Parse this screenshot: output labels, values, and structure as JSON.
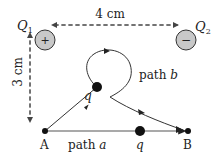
{
  "diagram": {
    "type": "physics-electric-field-paths",
    "charges": [
      {
        "id": "Q1",
        "label": "Q",
        "subscript": "1",
        "sign": "+",
        "fill": "#c8c8c8"
      },
      {
        "id": "Q2",
        "label": "Q",
        "subscript": "2",
        "sign": "−",
        "fill": "#c8c8c8"
      }
    ],
    "dimensions": {
      "horizontal": "4 cm",
      "vertical": "3 cm"
    },
    "points": {
      "start": "A",
      "end": "B"
    },
    "test_charge": "q",
    "paths": {
      "a": {
        "prefix": "path ",
        "name": "a"
      },
      "b": {
        "prefix": "path ",
        "name": "b"
      }
    },
    "colors": {
      "line": "#333333",
      "dashed": "#444444",
      "charge_fill": "#c8c8c8",
      "dot": "#111111"
    }
  }
}
